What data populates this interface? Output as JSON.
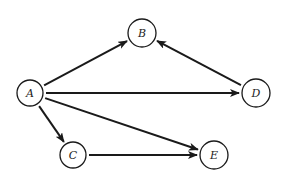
{
  "diagram": {
    "type": "directed-graph",
    "nodes": [
      {
        "id": "A",
        "label": "A",
        "x": 30,
        "y": 93,
        "r": 13
      },
      {
        "id": "B",
        "label": "B",
        "x": 142,
        "y": 33,
        "r": 14
      },
      {
        "id": "C",
        "label": "C",
        "x": 73,
        "y": 155,
        "r": 13
      },
      {
        "id": "D",
        "label": "D",
        "x": 256,
        "y": 93,
        "r": 14
      },
      {
        "id": "E",
        "label": "E",
        "x": 214,
        "y": 155,
        "r": 14
      }
    ],
    "edges": [
      {
        "from": "A",
        "to": "B"
      },
      {
        "from": "D",
        "to": "B"
      },
      {
        "from": "A",
        "to": "D"
      },
      {
        "from": "A",
        "to": "C"
      },
      {
        "from": "A",
        "to": "E"
      },
      {
        "from": "C",
        "to": "E"
      }
    ],
    "colors": {
      "stroke": "#1a1a1a",
      "background": "#ffffff"
    }
  }
}
